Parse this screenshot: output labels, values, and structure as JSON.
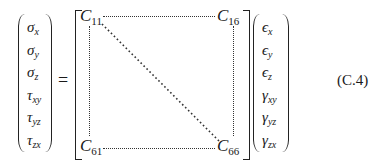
{
  "equation": {
    "stress_vector": [
      {
        "sym": "σ",
        "sub": "x"
      },
      {
        "sym": "σ",
        "sub": "y"
      },
      {
        "sym": "σ",
        "sub": "z"
      },
      {
        "sym": "τ",
        "sub": "xy"
      },
      {
        "sym": "τ",
        "sub": "yz"
      },
      {
        "sym": "τ",
        "sub": "zx"
      }
    ],
    "equals": "=",
    "matrix": {
      "top_left": {
        "sym": "C",
        "sub": "11"
      },
      "top_right": {
        "sym": "C",
        "sub": "16"
      },
      "bottom_left": {
        "sym": "C",
        "sub": "61"
      },
      "bottom_right": {
        "sym": "C",
        "sub": "66"
      }
    },
    "strain_vector": [
      {
        "sym": "ϵ",
        "sub": "x"
      },
      {
        "sym": "ϵ",
        "sub": "y"
      },
      {
        "sym": "ϵ",
        "sub": "z"
      },
      {
        "sym": "γ",
        "sub": "xy"
      },
      {
        "sym": "γ",
        "sub": "yz"
      },
      {
        "sym": "γ",
        "sub": "zx"
      }
    ],
    "label": "(C.4)"
  }
}
